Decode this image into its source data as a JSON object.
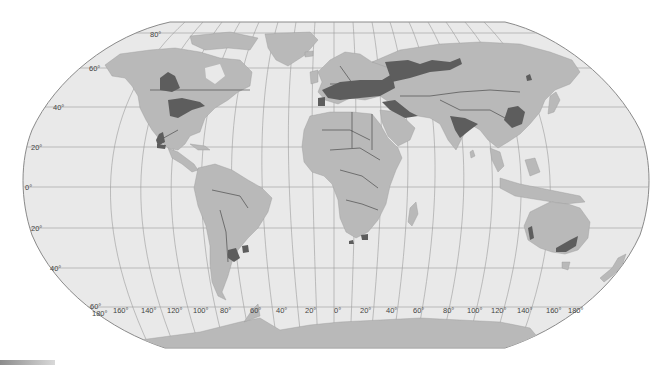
{
  "map": {
    "projection": "Robinson",
    "colors": {
      "ocean": "#e9e9e9",
      "land": "#b9b9b9",
      "highlight_region": "#5d5d5d",
      "graticule": "#9b9b9b",
      "borders": "#3a3a3a"
    },
    "latitude_labels": {
      "n80": "80°",
      "n60": "60°",
      "n40": "40°",
      "n20": "20°",
      "eq": "0°",
      "s20": "20°",
      "s40": "40°",
      "s60": "60°"
    },
    "longitude_labels": {
      "w180": "180°",
      "w160": "160°",
      "w140": "140°",
      "w120": "120°",
      "w100": "100°",
      "w80": "80°",
      "w60": "60°",
      "w40": "40°",
      "w20": "20°",
      "zero": "0°",
      "e20": "20°",
      "e40": "40°",
      "e60": "60°",
      "e80": "80°",
      "e100": "100°",
      "e120": "120°",
      "e140": "140°",
      "e160": "160°",
      "e180": "180°"
    },
    "highlighted_regions": [
      "Canadian Prairies",
      "US Midwest / Great Plains",
      "Central Mexico",
      "Pampas (Argentina / Uruguay)",
      "Europe (France to Ukraine)",
      "Russian steppe / Western Siberia",
      "Turkey / Middle East",
      "Northern India / Pakistan",
      "North China Plain",
      "Northeast China",
      "South Africa",
      "Western Australia",
      "Southeastern Australia"
    ]
  }
}
